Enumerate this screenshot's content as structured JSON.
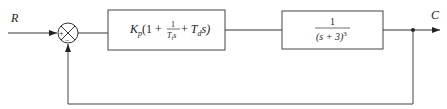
{
  "diagram": {
    "type": "block-diagram",
    "input_label": "R",
    "output_label": "C",
    "summing_junction": {
      "plus_sign": "+",
      "minus_sign": "−"
    },
    "controller_block": {
      "prefix": "K",
      "prefix_sub": "p",
      "open": "(1 + ",
      "frac_num": "1",
      "frac_den": "T",
      "frac_den_sub": "i",
      "frac_den_tail": "s",
      "plus": " + ",
      "td": "T",
      "td_sub": "d",
      "td_tail": "s)"
    },
    "plant_block": {
      "numerator": "1",
      "denominator": "(s + 3)",
      "exponent": "3"
    },
    "feedback": "unity negative feedback"
  }
}
